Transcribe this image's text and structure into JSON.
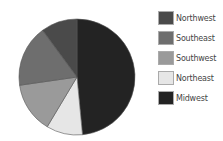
{
  "chart_data": {
    "type": "pie",
    "title": "",
    "categories": [
      "Midwest",
      "Northeast",
      "Southwest",
      "Southeast",
      "Northwest"
    ],
    "values": [
      48,
      10,
      14,
      17,
      10
    ],
    "unit": "percent (estimated)",
    "colors": {
      "Northwest": "#4a4a4a",
      "Southeast": "#6e6e6e",
      "Southwest": "#9a9a9a",
      "Northeast": "#e6e6e6",
      "Midwest": "#232323"
    },
    "legend_order": [
      "Northwest",
      "Southeast",
      "Southwest",
      "Northeast",
      "Midwest"
    ],
    "legend_position": "right",
    "start_angle_deg": 0,
    "direction": "clockwise"
  },
  "legend": {
    "items": [
      {
        "label": "Northwest",
        "color": "#4a4a4a"
      },
      {
        "label": "Southeast",
        "color": "#6e6e6e"
      },
      {
        "label": "Southwest",
        "color": "#9a9a9a"
      },
      {
        "label": "Northeast",
        "color": "#e6e6e6"
      },
      {
        "label": "Midwest",
        "color": "#232323"
      }
    ]
  }
}
